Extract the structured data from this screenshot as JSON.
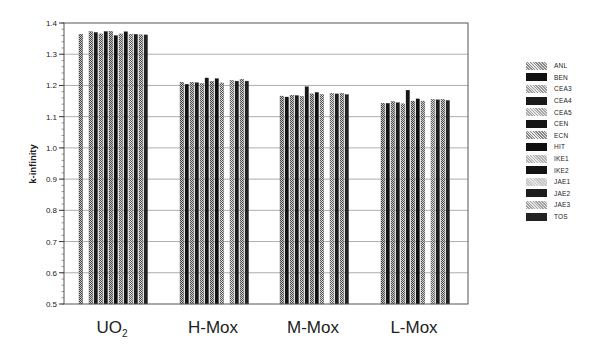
{
  "chart_data": {
    "type": "bar",
    "title": "",
    "xlabel": "",
    "ylabel": "k-infinity",
    "ylim": [
      0.5,
      1.4
    ],
    "yticks": [
      "0.5",
      "0.6",
      "0.7",
      "0.8",
      "0.9",
      "1.0",
      "1.1",
      "1.2",
      "1.3",
      "1.4"
    ],
    "grid": true,
    "legend_position": "right",
    "categories": [
      "UO2",
      "H-Mox",
      "M-Mox",
      "L-Mox"
    ],
    "category_labels": [
      {
        "main": "UO",
        "sub": "2"
      },
      {
        "main": "H-Mox",
        "sub": ""
      },
      {
        "main": "M-Mox",
        "sub": ""
      },
      {
        "main": "L-Mox",
        "sub": ""
      }
    ],
    "series": [
      {
        "name": "ANL",
        "values": [
          1.364,
          1.21,
          1.166,
          1.143
        ]
      },
      {
        "name": "BEN",
        "values": [
          null,
          1.204,
          1.163,
          1.143
        ]
      },
      {
        "name": "CEA3",
        "values": [
          1.372,
          1.21,
          1.169,
          1.148
        ]
      },
      {
        "name": "CEA4",
        "values": [
          1.37,
          1.209,
          1.168,
          1.145
        ]
      },
      {
        "name": "CEA5",
        "values": [
          1.365,
          1.206,
          1.165,
          1.141
        ]
      },
      {
        "name": "CEN",
        "values": [
          1.373,
          1.224,
          1.196,
          1.185
        ]
      },
      {
        "name": "ECN",
        "values": [
          1.373,
          1.213,
          1.173,
          1.15
        ]
      },
      {
        "name": "HIT",
        "values": [
          1.36,
          1.222,
          1.178,
          1.157
        ]
      },
      {
        "name": "IKE1",
        "values": [
          1.365,
          1.208,
          1.171,
          1.15
        ]
      },
      {
        "name": "IKE2",
        "values": [
          1.372,
          null,
          null,
          null
        ]
      },
      {
        "name": "JAE1",
        "values": [
          1.364,
          1.216,
          1.175,
          1.155
        ]
      },
      {
        "name": "JAE2",
        "values": [
          1.364,
          1.214,
          1.173,
          1.154
        ]
      },
      {
        "name": "JAE3",
        "values": [
          1.362,
          1.22,
          1.175,
          1.155
        ]
      },
      {
        "name": "TOS",
        "values": [
          1.362,
          1.214,
          1.171,
          1.152
        ]
      }
    ],
    "series_colors": [
      "#8a8a8a",
      "#111111",
      "#9a9a9a",
      "#1a1a1a",
      "#a8a8a8",
      "#151515",
      "#888888",
      "#0e0e0e",
      "#b0b0b0",
      "#121212",
      "#c4c4c4",
      "#1c1c1c",
      "#a0a0a0",
      "#222222"
    ]
  }
}
